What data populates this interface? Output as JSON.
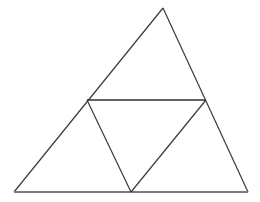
{
  "figure": {
    "canvas": {
      "width": 260,
      "height": 202,
      "background_color": "#ffffff"
    },
    "style": {
      "outline_color": "#3a3a3a",
      "outline_width": 1.2,
      "base_color": "#7d7d7d",
      "base_width": 1.8,
      "chord_color": "#2e2e2e",
      "chord_width": 1.4
    },
    "points": {
      "apex": {
        "name": "apex",
        "x": 163,
        "y": 8
      },
      "bottom_left": {
        "name": "bottom-left",
        "x": 14,
        "y": 192
      },
      "bottom_right": {
        "name": "bottom-right",
        "x": 248,
        "y": 192
      },
      "left_mid": {
        "name": "left-mid",
        "x": 87,
        "y": 100
      },
      "right_mid": {
        "name": "right-mid",
        "x": 206,
        "y": 100
      },
      "bottom_mid": {
        "name": "bottom-mid",
        "x": 131,
        "y": 192
      }
    },
    "segments": [
      {
        "name": "left-outer-edge",
        "from": "bottom_left",
        "to": "apex",
        "path": "M 14 192 L 163 8",
        "role": "outline"
      },
      {
        "name": "right-outer-edge",
        "from": "apex",
        "to": "bottom_right",
        "path": "M 163 8 L 248 192",
        "role": "outline"
      },
      {
        "name": "base-edge",
        "from": "bottom_left",
        "to": "bottom_right",
        "path": "M 14 192 L 248 192",
        "role": "base"
      },
      {
        "name": "horizontal-chord",
        "from": "left_mid",
        "to": "right_mid",
        "path": "M 87 100 L 206 100",
        "role": "chord"
      },
      {
        "name": "left-inner-edge",
        "from": "left_mid",
        "to": "bottom_mid",
        "path": "M 87 100 L 131 192",
        "role": "chord"
      },
      {
        "name": "right-inner-edge",
        "from": "bottom_mid",
        "to": "right_mid",
        "path": "M 131 192 L 206 100",
        "role": "chord"
      }
    ],
    "regions": [
      {
        "name": "top-triangle",
        "path": "M 87 100 L 163 8 L 206 100 Z"
      },
      {
        "name": "left-triangle",
        "path": "M 14 192 L 87 100 L 131 192 Z"
      },
      {
        "name": "center-inverted-triangle",
        "path": "M 87 100 L 206 100 L 131 192 Z"
      },
      {
        "name": "right-triangle",
        "path": "M 131 192 L 206 100 L 248 192 Z"
      }
    ]
  }
}
